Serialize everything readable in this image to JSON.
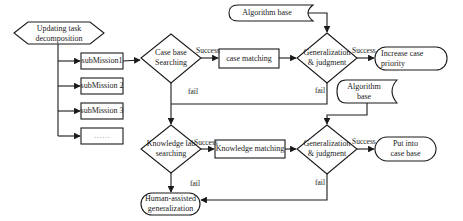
{
  "diagram": {
    "type": "flowchart",
    "nodes": {
      "start": {
        "label_line1": "Updating task",
        "label_line2": "decomposition",
        "shape": "hexagon"
      },
      "sub1": {
        "label": "subMission1",
        "shape": "rectangle"
      },
      "sub2": {
        "label": "subMission 2",
        "shape": "rectangle"
      },
      "sub3": {
        "label": "subMission 3",
        "shape": "rectangle"
      },
      "sub_more": {
        "label": "……",
        "shape": "rectangle"
      },
      "case_search": {
        "label_line1": "Case base",
        "label_line2": "Searching",
        "shape": "diamond"
      },
      "case_match": {
        "label": "case matching",
        "shape": "rectangle"
      },
      "algo1": {
        "label": "Algorithm base",
        "shape": "stored-data"
      },
      "gen1": {
        "label_line1": "Generalization",
        "label_line2": "& judgment",
        "shape": "diamond"
      },
      "increase": {
        "label_line1": "Increase case",
        "label_line2": "priority",
        "shape": "terminator"
      },
      "algo2": {
        "label_line1": "Algorithm",
        "label_line2": "base",
        "shape": "stored-data"
      },
      "know_search": {
        "label_line1": "Knowledge lab",
        "label_line2": "searching",
        "shape": "diamond"
      },
      "know_match": {
        "label": "Knowledge matching",
        "shape": "rectangle"
      },
      "gen2": {
        "label_line1": "Generalization",
        "label_line2": "& judgment",
        "shape": "diamond"
      },
      "put_case": {
        "label_line1": "Put into",
        "label_line2": "case base",
        "shape": "terminator"
      },
      "human": {
        "label_line1": "Human-assisted",
        "label_line2": "generalization",
        "shape": "terminator"
      }
    },
    "edges": {
      "case_success": "Success",
      "case_fail": "fail",
      "gen1_success": "Success",
      "gen1_fail": "fail",
      "know_success": "Success",
      "know_fail": "fail",
      "gen2_success": "Success",
      "gen2_fail": "fail"
    },
    "colors": {
      "stroke": "#1a1a1a",
      "fill": "#ffffff",
      "text": "#1a1a1a"
    }
  }
}
